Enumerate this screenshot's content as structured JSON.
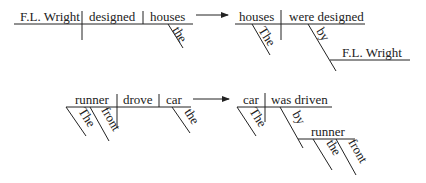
{
  "diagrams": {
    "active_1": {
      "subject": "F.L. Wright",
      "verb": "designed",
      "object": "houses",
      "object_modifier": "the"
    },
    "passive_1": {
      "subject": "houses",
      "subject_modifier": "The",
      "verb": "were designed",
      "preposition": "by",
      "prep_object": "F.L. Wright"
    },
    "active_2": {
      "subject": "runner",
      "subject_modifiers": [
        "The",
        "front"
      ],
      "verb": "drove",
      "object": "car",
      "object_modifier": "the"
    },
    "passive_2": {
      "subject": "car",
      "subject_modifier": "The",
      "verb": "was driven",
      "preposition": "by",
      "prep_object": "runner",
      "prep_object_modifiers": [
        "the",
        "front"
      ]
    }
  },
  "arrows": [
    {
      "from": "active_1",
      "to": "passive_1"
    },
    {
      "from": "active_2",
      "to": "passive_2"
    }
  ]
}
